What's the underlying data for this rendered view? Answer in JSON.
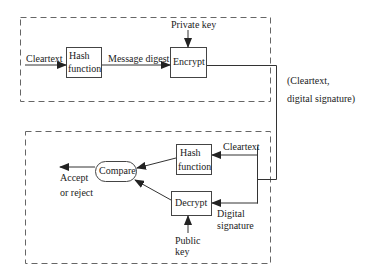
{
  "diagram": {
    "sender": {
      "input_label": "Cleartext",
      "hash_box": [
        "Hash",
        "function"
      ],
      "digest_label": "Message digest",
      "key_label": "Private key",
      "encrypt_box": "Encrypt"
    },
    "channel": {
      "label_line1": "(Cleartext,",
      "label_line2": "digital signature)"
    },
    "receiver": {
      "cleartext_label": "Cleartext",
      "hash_box": [
        "Hash",
        "function"
      ],
      "signature_label": [
        "Digital",
        "signature"
      ],
      "decrypt_box": "Decrypt",
      "key_label": [
        "Public",
        "key"
      ],
      "compare_node": "Compare",
      "output_label": [
        "Accept",
        "or reject"
      ]
    },
    "colors": {
      "line": "#333333",
      "dash": "#555555",
      "box_border": "#444444"
    }
  }
}
